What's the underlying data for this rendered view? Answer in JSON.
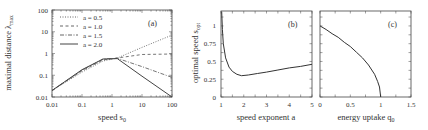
{
  "chart_data": [
    {
      "panel": "(a)",
      "type": "line",
      "xlabel": "speed s0",
      "ylabel": "maximal distance λmax",
      "xscale": "log",
      "yscale": "log",
      "xlim": [
        0.01,
        100
      ],
      "ylim": [
        0.01,
        100
      ],
      "xticks": [
        "0.01",
        "0.1",
        "1",
        "10",
        "100"
      ],
      "yticks": [
        "0.01",
        "0.1",
        "1",
        "10",
        "100"
      ],
      "legend_position": "upper left",
      "series": [
        {
          "name": "a = 0.5",
          "style": "dotted",
          "x": [
            0.01,
            0.1,
            0.5,
            1.5,
            10,
            100
          ],
          "y": [
            0.02,
            0.14,
            0.45,
            0.62,
            1.9,
            7.0
          ]
        },
        {
          "name": "a = 1.0",
          "style": "dashed",
          "x": [
            0.01,
            0.1,
            0.5,
            1.5,
            10,
            100
          ],
          "y": [
            0.02,
            0.16,
            0.5,
            0.62,
            0.9,
            0.95
          ]
        },
        {
          "name": "a = 1.5",
          "style": "dashdot",
          "x": [
            0.01,
            0.1,
            0.5,
            1.5,
            10,
            100
          ],
          "y": [
            0.02,
            0.17,
            0.55,
            0.6,
            0.25,
            0.08
          ]
        },
        {
          "name": "a = 2.0",
          "style": "solid",
          "x": [
            0.01,
            0.1,
            0.5,
            1.5,
            10,
            100
          ],
          "y": [
            0.02,
            0.18,
            0.56,
            0.58,
            0.09,
            0.01
          ]
        }
      ]
    },
    {
      "panel": "(b)",
      "type": "line",
      "xlabel": "speed exponent a",
      "ylabel": "optimal speed s_opt",
      "xlim": [
        1,
        5
      ],
      "ylim": [
        0,
        1.2
      ],
      "xticks": [
        "1",
        "2",
        "3",
        "4",
        "5"
      ],
      "yticks": [
        "0",
        "0.25",
        "0.5",
        "0.75",
        "1"
      ],
      "series": [
        {
          "name": "s_opt",
          "style": "solid",
          "x": [
            1.03,
            1.06,
            1.1,
            1.2,
            1.35,
            1.5,
            1.7,
            1.9,
            2.2,
            2.6,
            3.0,
            3.5,
            4.0,
            4.5,
            5.0
          ],
          "y": [
            1.2,
            0.95,
            0.75,
            0.55,
            0.42,
            0.36,
            0.32,
            0.3,
            0.31,
            0.33,
            0.35,
            0.38,
            0.41,
            0.43,
            0.46
          ]
        }
      ]
    },
    {
      "panel": "(c)",
      "type": "line",
      "xlabel": "energy uptake q0",
      "ylabel": "",
      "xlim": [
        0,
        1.5
      ],
      "ylim": [
        0,
        1.2
      ],
      "xticks": [
        "0",
        "0.5",
        "1",
        "1.5"
      ],
      "yticks": [],
      "series": [
        {
          "name": "s_opt",
          "style": "solid",
          "x": [
            0,
            0.1,
            0.2,
            0.3,
            0.4,
            0.5,
            0.6,
            0.7,
            0.8,
            0.9,
            0.95,
            0.98,
            1.0
          ],
          "y": [
            1.0,
            0.95,
            0.89,
            0.84,
            0.77,
            0.71,
            0.63,
            0.55,
            0.45,
            0.32,
            0.22,
            0.14,
            0.0
          ]
        }
      ]
    }
  ],
  "labels": {
    "a": {
      "panel": "(a)",
      "xlabel_main": "speed s",
      "xlabel_sub": "0",
      "ylabel_main": "maximal distance λ",
      "ylabel_sub": "max",
      "xticks": [
        "0.01",
        "0.1",
        "1",
        "10",
        "100"
      ],
      "yticks": [
        "0.01",
        "0.1",
        "1",
        "10",
        "100"
      ],
      "legend": [
        "a = 0.5",
        "a = 1.0",
        "a = 1.5",
        "a = 2.0"
      ]
    },
    "b": {
      "panel": "(b)",
      "xlabel": "speed exponent a",
      "ylabel_main": "optimal speed s",
      "ylabel_sub": "opt",
      "xticks": [
        "1",
        "2",
        "3",
        "4",
        "5"
      ],
      "yticks": [
        "0",
        "0.25",
        "0.5",
        "0.75",
        "1"
      ]
    },
    "c": {
      "panel": "(c)",
      "xlabel_main": "energy uptake q",
      "xlabel_sub": "0",
      "xticks": [
        "0",
        "0.5",
        "1",
        "1.5"
      ]
    }
  }
}
